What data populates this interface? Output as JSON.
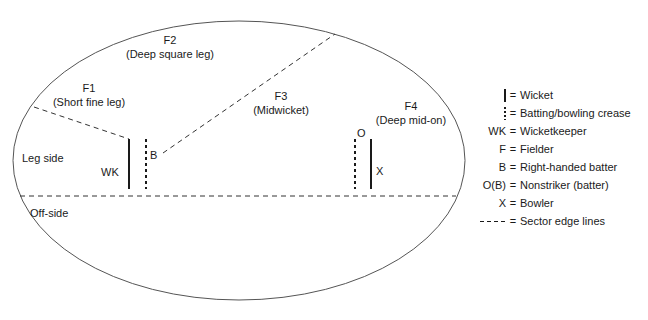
{
  "diagram": {
    "field": {
      "side_labels": [
        {
          "name": "leg-side",
          "text": "Leg side",
          "x": 22,
          "y": 152
        },
        {
          "name": "off-side",
          "text": "Off-side",
          "x": 30,
          "y": 207
        }
      ],
      "players": [
        {
          "name": "wicketkeeper-marker",
          "text": "WK",
          "x": 101,
          "y": 166
        },
        {
          "name": "batter-marker",
          "text": "B",
          "x": 150,
          "y": 149
        },
        {
          "name": "nonstriker-marker",
          "text": "O",
          "x": 357,
          "y": 127
        },
        {
          "name": "bowler-marker",
          "text": "X",
          "x": 376,
          "y": 165
        }
      ],
      "fielders": [
        {
          "code": "F1",
          "position": "(Short fine leg)",
          "x": 89,
          "y": 81
        },
        {
          "code": "F2",
          "position": "(Deep square leg)",
          "x": 170,
          "y": 33
        },
        {
          "code": "F3",
          "position": "(Midwicket)",
          "x": 281,
          "y": 89
        },
        {
          "code": "F4",
          "position": "(Deep mid-on)",
          "x": 411,
          "y": 99
        }
      ]
    },
    "legend": {
      "rows": [
        {
          "symbol_type": "wicket-bar",
          "symbol_text": "",
          "equals": "=",
          "description": "Wicket"
        },
        {
          "symbol_type": "crease-bar",
          "symbol_text": "",
          "equals": "=",
          "description": "Batting/bowling crease"
        },
        {
          "symbol_type": "text",
          "symbol_text": "WK",
          "equals": "=",
          "description": "Wicketkeeper"
        },
        {
          "symbol_type": "text",
          "symbol_text": "F",
          "equals": "=",
          "description": "Fielder"
        },
        {
          "symbol_type": "text",
          "symbol_text": "B",
          "equals": "=",
          "description": "Right-handed batter"
        },
        {
          "symbol_type": "text",
          "symbol_text": "O(B)",
          "equals": "=",
          "description": "Nonstriker (batter)"
        },
        {
          "symbol_type": "text",
          "symbol_text": "X",
          "equals": "=",
          "description": "Bowler"
        },
        {
          "symbol_type": "dash-line",
          "symbol_text": "",
          "equals": "=",
          "description": "Sector edge lines"
        }
      ]
    },
    "colors": {
      "stroke": "#444444",
      "ink": "#1a1a1a",
      "background": "#ffffff"
    }
  }
}
